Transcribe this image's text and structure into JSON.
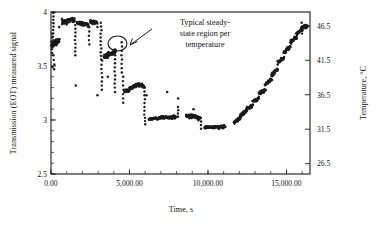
{
  "figure": {
    "background": "#ffffff",
    "ink_color": "#1b1b1b"
  },
  "annotation": {
    "line1": "Typical steady-",
    "line2": "state region per",
    "line3": "temperature",
    "marker": "circle-callout"
  },
  "chart_data": {
    "type": "scatter",
    "title": "",
    "xlabel": "Time, s",
    "ylabel": "Transmission (EOT) measured signal",
    "y2label": "Temperature, °C",
    "xlim": [
      0,
      16500
    ],
    "ylim": [
      2.5,
      4
    ],
    "y2lim": [
      48.5,
      25.0
    ],
    "grid": false,
    "legend": "none",
    "xticks": [
      0,
      5000,
      10000,
      15000
    ],
    "xticklabels": [
      "0.00",
      "5,000.00",
      "10,000.00",
      "15,000.00"
    ],
    "xminor_step": 1000,
    "yticks": [
      2.5,
      3,
      3.5,
      4
    ],
    "yticklabels": [
      "2.5",
      "3",
      "3.5",
      "4"
    ],
    "yminor_step": 0.1,
    "y2ticks": [
      26.5,
      31.5,
      36.5,
      41.5,
      46.5
    ],
    "y2ticklabels": [
      "26.5",
      "31.5",
      "36.5",
      "41.5",
      "46.5"
    ],
    "annotation_text": "Typical steady-state region per temperature",
    "annotation_target_x": 3850,
    "annotation_target_y": 3.62,
    "series": [
      {
        "name": "EOT measured signal",
        "marker": "filled-circle",
        "color": "#1b1b1b",
        "description": "Stepwise descending then ascending transmission signal tracking a temperature ramp; each plateau is a steady-state region at one temperature.",
        "plateaus": [
          {
            "x_start": 60,
            "x_end": 520,
            "y_start": 3.7,
            "y_end": 3.73,
            "scatter": 0.03,
            "n": 34
          },
          {
            "x_start": 700,
            "x_end": 1500,
            "y_start": 3.91,
            "y_end": 3.93,
            "scatter": 0.022,
            "n": 48
          },
          {
            "x_start": 1650,
            "x_end": 2400,
            "y_start": 3.9,
            "y_end": 3.88,
            "scatter": 0.02,
            "n": 44
          },
          {
            "x_start": 2500,
            "x_end": 2950,
            "y_start": 3.91,
            "y_end": 3.9,
            "scatter": 0.02,
            "n": 28
          },
          {
            "x_start": 3350,
            "x_end": 4150,
            "y_start": 3.58,
            "y_end": 3.64,
            "scatter": 0.022,
            "n": 46
          },
          {
            "x_start": 4700,
            "x_end": 5450,
            "y_start": 3.26,
            "y_end": 3.33,
            "scatter": 0.02,
            "n": 44
          },
          {
            "x_start": 5500,
            "x_end": 5950,
            "y_start": 3.33,
            "y_end": 3.31,
            "scatter": 0.02,
            "n": 26
          },
          {
            "x_start": 6250,
            "x_end": 7950,
            "y_start": 3.01,
            "y_end": 3.03,
            "scatter": 0.016,
            "n": 90
          },
          {
            "x_start": 8600,
            "x_end": 9500,
            "y_start": 3.04,
            "y_end": 3.02,
            "scatter": 0.018,
            "n": 50
          },
          {
            "x_start": 9800,
            "x_end": 11100,
            "y_start": 2.93,
            "y_end": 2.94,
            "scatter": 0.014,
            "n": 68
          },
          {
            "x_start": 11650,
            "x_end": 12050,
            "y_start": 2.98,
            "y_end": 3.02,
            "scatter": 0.018,
            "n": 24
          },
          {
            "x_start": 12050,
            "x_end": 12450,
            "y_start": 3.04,
            "y_end": 3.08,
            "scatter": 0.018,
            "n": 24
          },
          {
            "x_start": 12450,
            "x_end": 12850,
            "y_start": 3.1,
            "y_end": 3.14,
            "scatter": 0.018,
            "n": 24
          },
          {
            "x_start": 12850,
            "x_end": 13250,
            "y_start": 3.17,
            "y_end": 3.21,
            "scatter": 0.018,
            "n": 24
          },
          {
            "x_start": 13250,
            "x_end": 13650,
            "y_start": 3.24,
            "y_end": 3.28,
            "scatter": 0.018,
            "n": 24
          },
          {
            "x_start": 13650,
            "x_end": 14050,
            "y_start": 3.33,
            "y_end": 3.37,
            "scatter": 0.018,
            "n": 24
          },
          {
            "x_start": 14050,
            "x_end": 14450,
            "y_start": 3.42,
            "y_end": 3.47,
            "scatter": 0.018,
            "n": 24
          },
          {
            "x_start": 14450,
            "x_end": 14850,
            "y_start": 3.53,
            "y_end": 3.58,
            "scatter": 0.018,
            "n": 24
          },
          {
            "x_start": 14850,
            "x_end": 15250,
            "y_start": 3.63,
            "y_end": 3.68,
            "scatter": 0.018,
            "n": 24
          },
          {
            "x_start": 15250,
            "x_end": 15650,
            "y_start": 3.72,
            "y_end": 3.77,
            "scatter": 0.018,
            "n": 24
          },
          {
            "x_start": 15650,
            "x_end": 16100,
            "y_start": 3.8,
            "y_end": 3.86,
            "scatter": 0.018,
            "n": 26
          },
          {
            "x_start": 16100,
            "x_end": 16350,
            "y_start": 3.86,
            "y_end": 3.87,
            "scatter": 0.02,
            "n": 14
          }
        ],
        "transitions": [
          {
            "x": 150,
            "y_top": 3.99,
            "y_bottom": 3.74,
            "n": 9
          },
          {
            "x": 60,
            "y_top": 3.8,
            "y_bottom": 3.62,
            "n": 6
          },
          {
            "x": 180,
            "y_top": 3.6,
            "y_bottom": 3.47,
            "n": 4
          },
          {
            "x": 1560,
            "y_top": 3.88,
            "y_bottom": 3.6,
            "n": 9
          },
          {
            "x": 2430,
            "y_top": 3.86,
            "y_bottom": 3.7,
            "n": 5
          },
          {
            "x": 3180,
            "y_top": 3.9,
            "y_bottom": 3.56,
            "n": 11
          },
          {
            "x": 3230,
            "y_top": 3.55,
            "y_bottom": 3.28,
            "n": 8
          },
          {
            "x": 4080,
            "y_top": 3.6,
            "y_bottom": 3.3,
            "n": 9
          },
          {
            "x": 4500,
            "y_top": 3.72,
            "y_bottom": 3.44,
            "n": 8
          },
          {
            "x": 4600,
            "y_top": 3.4,
            "y_bottom": 3.16,
            "n": 7
          },
          {
            "x": 5950,
            "y_top": 3.3,
            "y_bottom": 3.05,
            "n": 8
          },
          {
            "x": 6000,
            "y_top": 3.02,
            "y_bottom": 2.96,
            "n": 3
          },
          {
            "x": 8100,
            "y_top": 3.12,
            "y_bottom": 3.03,
            "n": 4
          },
          {
            "x": 9560,
            "y_top": 3.02,
            "y_bottom": 2.92,
            "n": 4
          },
          {
            "x": 15980,
            "y_top": 3.9,
            "y_bottom": 3.8,
            "n": 4
          }
        ],
        "outliers": [
          {
            "x": 95,
            "y": 3.49
          },
          {
            "x": 1580,
            "y": 3.32
          },
          {
            "x": 2960,
            "y": 3.23
          },
          {
            "x": 4080,
            "y": 3.26
          },
          {
            "x": 6080,
            "y": 3.23
          },
          {
            "x": 7400,
            "y": 3.26
          },
          {
            "x": 8100,
            "y": 3.2
          },
          {
            "x": 3620,
            "y": 3.4
          },
          {
            "x": 9080,
            "y": 3.1
          },
          {
            "x": 520,
            "y": 3.86
          },
          {
            "x": 2960,
            "y": 3.86
          }
        ]
      }
    ]
  }
}
